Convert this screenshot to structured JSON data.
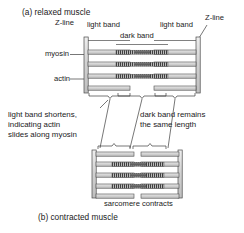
{
  "figure": {
    "caption_a": "(a) relaxed muscle",
    "caption_b": "(b) contracted muscle",
    "bottom_label": "sarcomere contracts"
  },
  "labels": {
    "z_line_left": "Z-line",
    "z_line_right": "Z-line",
    "light_band_left": "light band",
    "light_band_right": "light band",
    "dark_band": "dark band",
    "myosin": "myosin",
    "actin": "actin"
  },
  "annotations": {
    "left_note_line1": "light band shortens,",
    "left_note_line2": "indicating actin",
    "left_note_line3": "slides along myosin",
    "right_note_line1": "dark band remains",
    "right_note_line2": "the same length"
  },
  "colors": {
    "ink": "#1a1a1a",
    "outline": "#4a4a4a",
    "filament_fill": "#d8d8d8",
    "myosin_dark": "#5a5a5a",
    "background": "#ffffff"
  },
  "diagram": {
    "relaxed": {
      "name": "relaxed-sarcomere",
      "myofibril_rows": 3,
      "z_line_left_x": 86,
      "z_line_right_x": 205,
      "sarcomere_width_px": 119
    },
    "contracted": {
      "name": "contracted-sarcomere",
      "myofibril_rows": 3,
      "z_line_left_x": 96,
      "z_line_right_x": 190,
      "sarcomere_width_px": 94
    }
  }
}
